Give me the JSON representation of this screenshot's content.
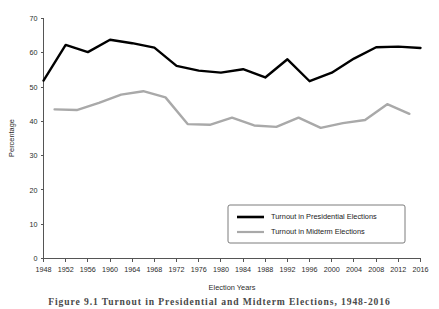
{
  "figure": {
    "caption": "Figure 9.1   Turnout in Presidential and Midterm Elections, 1948-2016"
  },
  "chart_data": {
    "type": "line",
    "title": "",
    "xlabel": "Election Years",
    "ylabel": "Percentage",
    "xlim": [
      1948,
      2016
    ],
    "ylim": [
      0,
      70
    ],
    "y_tick_step": 10,
    "x_tick_step": 4,
    "grid": false,
    "legend_position": "bottom-right",
    "x_ticks": [
      1948,
      1952,
      1956,
      1960,
      1964,
      1968,
      1972,
      1976,
      1980,
      1984,
      1988,
      1992,
      1996,
      2000,
      2004,
      2008,
      2012,
      2016
    ],
    "y_ticks": [
      0,
      10,
      20,
      30,
      40,
      50,
      60,
      70
    ],
    "series": [
      {
        "name": "Turnout in Presidential Elections",
        "color": "#000000",
        "width": 2.4,
        "x": [
          1948,
          1952,
          1956,
          1960,
          1964,
          1968,
          1972,
          1976,
          1980,
          1984,
          1988,
          1992,
          1996,
          2000,
          2004,
          2008,
          2012,
          2016
        ],
        "values": [
          51.9,
          62.3,
          60.2,
          63.8,
          62.8,
          61.5,
          56.2,
          54.8,
          54.2,
          55.2,
          52.8,
          58.1,
          51.7,
          54.2,
          58.3,
          61.6,
          61.8,
          61.4
        ]
      },
      {
        "name": "Turnout in Midterm Elections",
        "color": "#a9a9a9",
        "width": 2.4,
        "x": [
          1950,
          1954,
          1958,
          1962,
          1966,
          1970,
          1974,
          1978,
          1982,
          1986,
          1990,
          1994,
          1998,
          2002,
          2006,
          2010,
          2014
        ],
        "values": [
          43.5,
          43.3,
          45.4,
          47.8,
          48.8,
          47.0,
          39.2,
          39.0,
          41.1,
          38.8,
          38.4,
          41.1,
          38.1,
          39.5,
          40.4,
          45.0,
          42.2
        ]
      }
    ]
  },
  "axes": {
    "y_axis_label": "Percentage",
    "x_axis_label": "Election Years"
  }
}
